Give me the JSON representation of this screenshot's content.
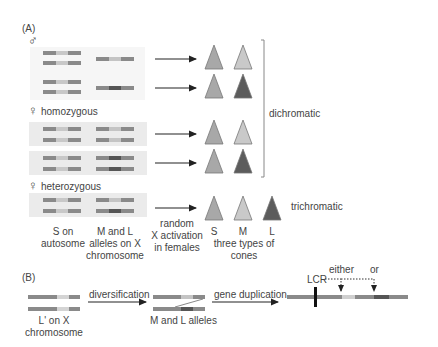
{
  "panel_a": {
    "label": "(A)",
    "groups": [
      {
        "symbol": "♂",
        "label": ""
      },
      {
        "symbol": "♀",
        "label": "homozygous"
      },
      {
        "symbol": "♀",
        "label": "heterozygous"
      }
    ],
    "bracket_label": "dichromatic",
    "trichromatic_label": "trichromatic",
    "captions": {
      "s_on_autosome": "S on\nautosome",
      "m_l_alleles": "M and L\nalleles on X\nchromosome",
      "random_x": "random\nX activation\nin females",
      "cone_s": "S",
      "cone_m": "M",
      "cone_l": "L",
      "three_types": "three types of cones"
    }
  },
  "panel_b": {
    "label": "(B)",
    "l_prime_caption": "L' on X\nchromosome",
    "diversification": "diversification",
    "ml_alleles": "M and L alleles",
    "gene_duplication": "gene duplication",
    "lcr": "LCR",
    "either": "either",
    "or": "or"
  },
  "colors": {
    "chromosome": "#8a8a8a",
    "s_gene": "#c8c8c8",
    "m_gene": "#bdbdbd",
    "l_gene": "#5a5a5a",
    "cone_s": "#a8a8a8",
    "cone_m": "#c9c9c9",
    "cone_l": "#5c5c5c"
  }
}
